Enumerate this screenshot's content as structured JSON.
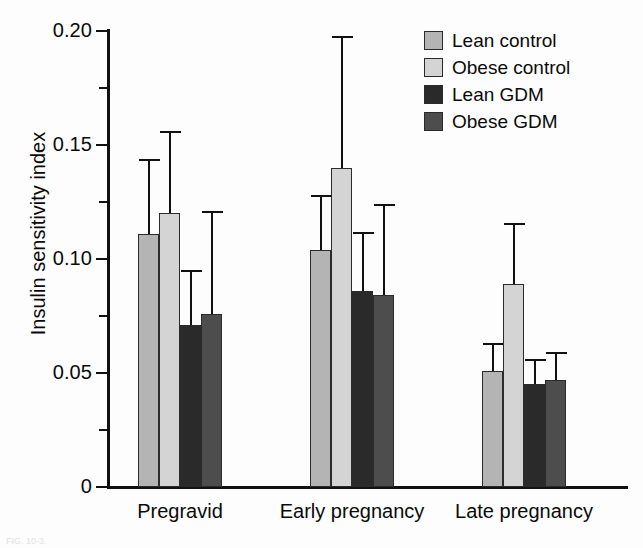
{
  "figure": {
    "caption_fragment": "FIG. 10-3."
  },
  "legend": {
    "position": "top-right",
    "items": [
      {
        "label": "Lean control",
        "color": "#b4b4b4"
      },
      {
        "label": "Obese control",
        "color": "#d4d4d4"
      },
      {
        "label": "Lean GDM",
        "color": "#2a2a2a"
      },
      {
        "label": "Obese GDM",
        "color": "#4d4d4d"
      }
    ]
  },
  "axes": {
    "y_title": "Insulin sensitivity index",
    "y_major_ticks": [
      "0",
      "0.05",
      "0.10",
      "0.15",
      "0.20"
    ],
    "y_major_values": [
      0,
      0.05,
      0.1,
      0.15,
      0.2
    ],
    "y_minor_values": [
      0.025,
      0.075,
      0.125,
      0.175
    ],
    "x_categories": [
      "Pregravid",
      "Early pregnancy",
      "Late pregnancy"
    ]
  },
  "chart_data": {
    "type": "bar",
    "title": "",
    "xlabel": "",
    "ylabel": "Insulin sensitivity index",
    "ylim": [
      0,
      0.2
    ],
    "grid": false,
    "legend_position": "top-right",
    "error_bars": "upper-only",
    "categories": [
      "Pregravid",
      "Early pregnancy",
      "Late pregnancy"
    ],
    "series": [
      {
        "name": "Lean control",
        "color": "#b4b4b4",
        "values": [
          0.111,
          0.104,
          0.051
        ],
        "error_upper": [
          0.144,
          0.128,
          0.063
        ]
      },
      {
        "name": "Obese control",
        "color": "#d4d4d4",
        "values": [
          0.12,
          0.14,
          0.089
        ],
        "error_upper": [
          0.156,
          0.198,
          0.116
        ]
      },
      {
        "name": "Lean GDM",
        "color": "#2a2a2a",
        "values": [
          0.071,
          0.086,
          0.045
        ],
        "error_upper": [
          0.095,
          0.112,
          0.056
        ]
      },
      {
        "name": "Obese GDM",
        "color": "#4d4d4d",
        "values": [
          0.076,
          0.084,
          0.047
        ],
        "error_upper": [
          0.121,
          0.124,
          0.059
        ]
      }
    ]
  }
}
